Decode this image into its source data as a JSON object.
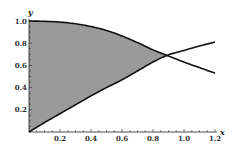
{
  "chart_data": {
    "type": "area",
    "title": "",
    "xlabel": "x",
    "ylabel": "y",
    "xlim": [
      0,
      1.2
    ],
    "ylim": [
      0,
      1.0
    ],
    "x_ticks": [
      "0.2",
      "0.4",
      "0.6",
      "0.8",
      "1.0",
      "1.2"
    ],
    "y_ticks": [
      "0.2",
      "0.4",
      "0.6",
      "0.8",
      "1.0"
    ],
    "grid": false,
    "legend": null,
    "fill_color": "#9a9a9a",
    "line_color": "#111111",
    "series": [
      {
        "name": "upper-curve",
        "x": [
          0,
          0.1,
          0.2,
          0.3,
          0.4,
          0.5,
          0.6,
          0.7,
          0.8,
          0.89,
          1.0,
          1.1,
          1.2
        ],
        "values": [
          1.0,
          0.997,
          0.99,
          0.975,
          0.95,
          0.915,
          0.865,
          0.805,
          0.74,
          0.69,
          0.63,
          0.58,
          0.53
        ]
      },
      {
        "name": "lower-curve",
        "x": [
          0,
          0.1,
          0.2,
          0.3,
          0.4,
          0.5,
          0.6,
          0.7,
          0.8,
          0.89,
          1.0,
          1.1,
          1.2
        ],
        "values": [
          0,
          0.085,
          0.165,
          0.245,
          0.325,
          0.4,
          0.47,
          0.55,
          0.63,
          0.69,
          0.735,
          0.775,
          0.81
        ]
      }
    ],
    "shaded_region": {
      "between": [
        "upper-curve",
        "lower-curve"
      ],
      "x_range": [
        0,
        0.89
      ]
    }
  }
}
